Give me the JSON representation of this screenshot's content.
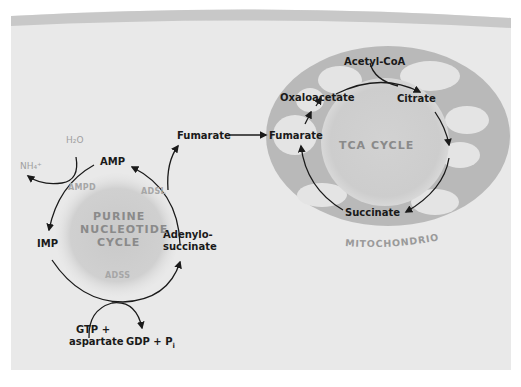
{
  "diagram": {
    "colors": {
      "background": "#e9e9e9",
      "top_band": "#c8c8c8",
      "mitochondrion_outer": "#b9b9b9",
      "cristae": "#e2e2e2",
      "cycle_disk": "#cfcfcf",
      "text": "#1a1a1a",
      "enzyme_text": "#a6a6a6"
    },
    "purine_cycle": {
      "title_line1": "PURINE",
      "title_line2": "NUCLEOTIDE",
      "title_line3": "CYCLE",
      "nodes": {
        "amp": "AMP",
        "imp": "IMP",
        "adenylosuccinate_line1": "Adenylo-",
        "adenylosuccinate_line2": "succinate"
      },
      "enzymes": {
        "ampd": "AMPD",
        "adsl": "ADSL",
        "adss": "ADSS"
      },
      "side_inputs": {
        "water": "H₂O",
        "ammonium": "NH₄⁺",
        "gtp_line1": "GTP +",
        "gtp_line2": "aspartate",
        "gdp": "GDP + P",
        "gdp_sub": "i"
      },
      "fumarate_out": "Fumarate"
    },
    "tca_cycle": {
      "title": "TCA CYCLE",
      "nodes": {
        "acetyl_coa": "Acetyl-CoA",
        "citrate": "Citrate",
        "oxaloacetate": "Oxaloacetate",
        "fumarate": "Fumarate",
        "succinate": "Succinate"
      }
    },
    "organelle_label": "MITOCHONDRION"
  }
}
